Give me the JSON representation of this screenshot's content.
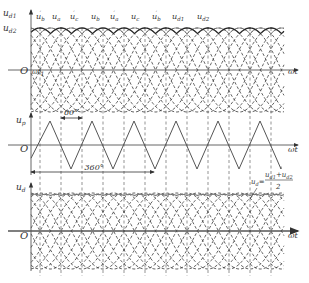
{
  "figure": {
    "width": 309,
    "height": 283,
    "colors": {
      "axis": "#555555",
      "ud1_envelope": "#2a2a2a",
      "ud2_envelope": "#7a7a7a",
      "dashed": "#3a3a3a",
      "guide": "#666666",
      "text": "#333333"
    },
    "geometry": {
      "axis_x": 31,
      "x_start": 31,
      "x_end": 284,
      "arrow_end": 298,
      "px_per_60deg": 21,
      "guide_first_x": 40,
      "guide_count": 12,
      "guide_top": 28,
      "guide_bottom": 276
    }
  },
  "panels": {
    "top": {
      "y_axis_label": "u",
      "y_axis_label_sub_1": "d1",
      "y_axis_label_sub_2": "d2",
      "origin_label": "O",
      "x_axis_label": "ωt",
      "wt1_label": "ωt",
      "wt1_sub": "1",
      "zero_y": 70,
      "amplitude": 42,
      "axis_top": 10,
      "curve_labels": [
        {
          "text": "u",
          "sub": "b",
          "prime": true,
          "x": 36
        },
        {
          "text": "u",
          "sub": "a",
          "prime": false,
          "x": 52
        },
        {
          "text": "u",
          "sub": "c",
          "prime": true,
          "x": 70
        },
        {
          "text": "u",
          "sub": "b",
          "prime": false,
          "x": 91
        },
        {
          "text": "u",
          "sub": "a",
          "prime": true,
          "x": 110
        },
        {
          "text": "u",
          "sub": "c",
          "prime": false,
          "x": 131
        },
        {
          "text": "u",
          "sub": "b",
          "prime": true,
          "x": 152
        },
        {
          "text": "u",
          "sub": "d1",
          "prime": false,
          "x": 172
        },
        {
          "text": "u",
          "sub": "d2",
          "prime": false,
          "x": 197
        }
      ]
    },
    "middle": {
      "y_axis_label": "u",
      "y_axis_label_sub": "p",
      "origin_label": "O",
      "x_axis_label": "ωt",
      "zero_y": 145,
      "amplitude": 24,
      "axis_top": 113,
      "triangle_peaks_x": [
        50,
        92,
        134,
        176,
        218,
        260
      ],
      "angle_60_label": "60°",
      "angle_60_from_x": 61,
      "angle_60_to_x": 82,
      "angle_60_y": 118,
      "angle_360_label": "360°",
      "angle_360_from_x": 31,
      "angle_360_to_x": 154,
      "angle_360_y": 172
    },
    "bottom": {
      "y_axis_label": "u",
      "y_axis_label_sub": "d",
      "origin_label": "O",
      "x_axis_label": "ωt",
      "zero_y": 231,
      "amplitude": 38,
      "axis_top": 183,
      "formula_lhs": "u",
      "formula_lhs_sub": "d",
      "formula_num": "u",
      "formula_num_sub1": "d1",
      "formula_num_plus": "+u",
      "formula_num_sub2": "d2",
      "formula_den": "2"
    }
  },
  "chart_data": {
    "type": "line",
    "xlabel": "ωt",
    "series": [
      {
        "name": "u_d1 (6-pulse envelope)",
        "panel": "top"
      },
      {
        "name": "u_d2 (6-pulse envelope, shifted 30°)",
        "panel": "top"
      },
      {
        "name": "u_p (triangular, period 120°)",
        "panel": "middle"
      },
      {
        "name": "u_d = (u_d1 + u_d2)/2",
        "panel": "bottom"
      }
    ],
    "annotations": [
      "60°",
      "360°",
      "ωt1"
    ]
  }
}
